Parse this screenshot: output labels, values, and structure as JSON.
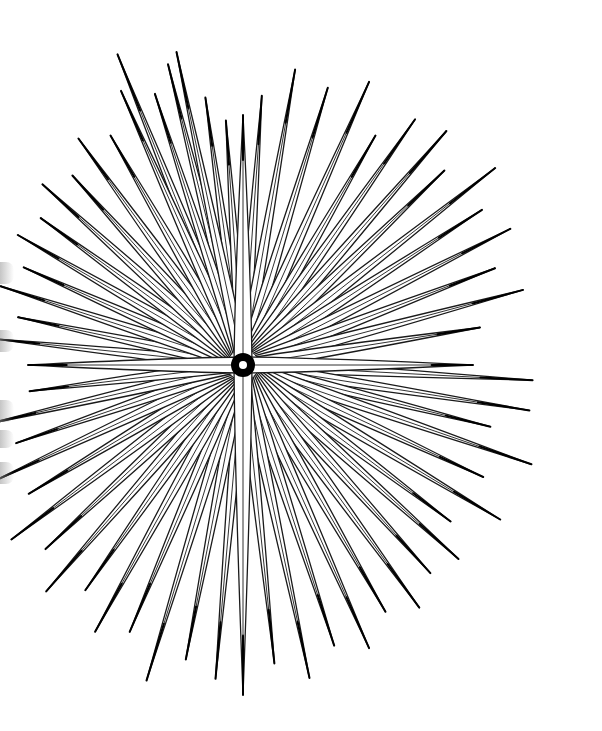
{
  "illustration": {
    "subject": "sea urchin spines line drawing",
    "background_color": "#ffffff",
    "ink_color": "#1a1a1a",
    "center": {
      "x": 243,
      "y": 365
    },
    "hub": {
      "outer_radius": 12,
      "inner_radius": 4,
      "fill": "#000000",
      "hole": "#ffffff"
    },
    "cross_spines": [
      {
        "angle": -90,
        "length": 250,
        "half_width": 9
      },
      {
        "angle": 90,
        "length": 330,
        "half_width": 9
      },
      {
        "angle": 0,
        "length": 230,
        "half_width": 8
      },
      {
        "angle": 180,
        "length": 215,
        "half_width": 8
      }
    ],
    "spines": [
      {
        "angle": -112,
        "length": 335
      },
      {
        "angle": -104,
        "length": 310
      },
      {
        "angle": -98,
        "length": 270
      },
      {
        "angle": -94,
        "length": 245
      },
      {
        "angle": -86,
        "length": 270
      },
      {
        "angle": -80,
        "length": 300
      },
      {
        "angle": -73,
        "length": 290
      },
      {
        "angle": -66,
        "length": 310
      },
      {
        "angle": -60,
        "length": 265
      },
      {
        "angle": -55,
        "length": 300
      },
      {
        "angle": -49,
        "length": 310
      },
      {
        "angle": -44,
        "length": 280
      },
      {
        "angle": -38,
        "length": 320
      },
      {
        "angle": -33,
        "length": 285
      },
      {
        "angle": -27,
        "length": 300
      },
      {
        "angle": -21,
        "length": 270
      },
      {
        "angle": -15,
        "length": 290
      },
      {
        "angle": -9,
        "length": 240
      },
      {
        "angle": 3,
        "length": 290
      },
      {
        "angle": 9,
        "length": 290
      },
      {
        "angle": 14,
        "length": 255
      },
      {
        "angle": 19,
        "length": 305
      },
      {
        "angle": 25,
        "length": 265
      },
      {
        "angle": 31,
        "length": 300
      },
      {
        "angle": 37,
        "length": 260
      },
      {
        "angle": 42,
        "length": 290
      },
      {
        "angle": 48,
        "length": 280
      },
      {
        "angle": 54,
        "length": 300
      },
      {
        "angle": 60,
        "length": 285
      },
      {
        "angle": 66,
        "length": 310
      },
      {
        "angle": 72,
        "length": 295
      },
      {
        "angle": 78,
        "length": 320
      },
      {
        "angle": 84,
        "length": 300
      },
      {
        "angle": 95,
        "length": 315
      },
      {
        "angle": 101,
        "length": 300
      },
      {
        "angle": 107,
        "length": 330
      },
      {
        "angle": 113,
        "length": 290
      },
      {
        "angle": 119,
        "length": 305
      },
      {
        "angle": 125,
        "length": 275
      },
      {
        "angle": 131,
        "length": 300
      },
      {
        "angle": 137,
        "length": 270
      },
      {
        "angle": 143,
        "length": 290
      },
      {
        "angle": 149,
        "length": 250
      },
      {
        "angle": 155,
        "length": 275
      },
      {
        "angle": 161,
        "length": 240
      },
      {
        "angle": 167,
        "length": 260
      },
      {
        "angle": 173,
        "length": 215
      },
      {
        "angle": 186,
        "length": 250
      },
      {
        "angle": 192,
        "length": 230
      },
      {
        "angle": 198,
        "length": 255
      },
      {
        "angle": 204,
        "length": 240
      },
      {
        "angle": 210,
        "length": 260
      },
      {
        "angle": 216,
        "length": 250
      },
      {
        "angle": 222,
        "length": 270
      },
      {
        "angle": 228,
        "length": 255
      },
      {
        "angle": 234,
        "length": 280
      },
      {
        "angle": 240,
        "length": 265
      },
      {
        "angle": 246,
        "length": 300
      },
      {
        "angle": 252,
        "length": 285
      },
      {
        "angle": 258,
        "length": 320
      }
    ],
    "spine_base_half_width": 6,
    "spine_inner_offset": 14,
    "edge_shadows": [
      {
        "y": 262,
        "height": 22
      },
      {
        "y": 330,
        "height": 22
      },
      {
        "y": 400,
        "height": 22
      },
      {
        "y": 430,
        "height": 18
      },
      {
        "y": 462,
        "height": 22
      }
    ]
  }
}
